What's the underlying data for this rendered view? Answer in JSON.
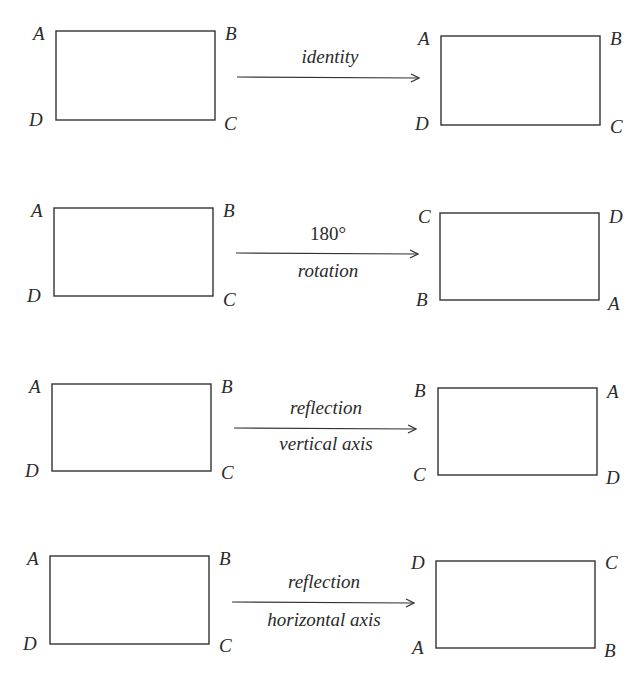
{
  "rows": [
    {
      "name": "identity",
      "label_top": "identity",
      "label_bottom": "",
      "left": {
        "tl": "A",
        "tr": "B",
        "bl": "D",
        "br": "C"
      },
      "right": {
        "tl": "A",
        "tr": "B",
        "bl": "D",
        "br": "C"
      }
    },
    {
      "name": "rotation-180",
      "label_top": "180°",
      "label_bottom": "rotation",
      "left": {
        "tl": "A",
        "tr": "B",
        "bl": "D",
        "br": "C"
      },
      "right": {
        "tl": "C",
        "tr": "D",
        "bl": "B",
        "br": "A"
      }
    },
    {
      "name": "reflection-vertical",
      "label_top": "reflection",
      "label_bottom": "vertical axis",
      "left": {
        "tl": "A",
        "tr": "B",
        "bl": "D",
        "br": "C"
      },
      "right": {
        "tl": "B",
        "tr": "A",
        "bl": "C",
        "br": "D"
      }
    },
    {
      "name": "reflection-horizontal",
      "label_top": "reflection",
      "label_bottom": "horizontal axis",
      "left": {
        "tl": "A",
        "tr": "B",
        "bl": "D",
        "br": "C"
      },
      "right": {
        "tl": "D",
        "tr": "C",
        "bl": "A",
        "br": "B"
      }
    }
  ]
}
